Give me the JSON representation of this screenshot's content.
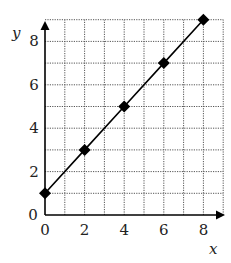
{
  "chart_data": {
    "type": "line",
    "title": "",
    "xlabel": "x",
    "ylabel": "y",
    "xlim": [
      0,
      9
    ],
    "ylim": [
      0,
      9
    ],
    "grid": true,
    "x_ticks": [
      0,
      2,
      4,
      6,
      8
    ],
    "y_ticks": [
      0,
      2,
      4,
      6,
      8
    ],
    "series": [
      {
        "name": "y = x + 1",
        "marker": "diamond",
        "color": "#000000",
        "x": [
          0,
          2,
          4,
          6,
          8
        ],
        "values": [
          1,
          3,
          5,
          7,
          9
        ]
      }
    ]
  },
  "axes": {
    "x_label": "x",
    "y_label": "y",
    "x_tick_labels": [
      "0",
      "2",
      "4",
      "6",
      "8"
    ],
    "y_tick_labels": [
      "0",
      "2",
      "4",
      "6",
      "8"
    ]
  },
  "colors": {
    "line": "#000000",
    "grid": "#555555",
    "axis": "#000000"
  }
}
